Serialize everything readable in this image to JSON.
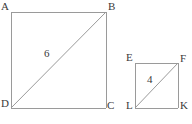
{
  "figure": {
    "background_color": "#ffffff",
    "stroke_color": "#9a9a9a",
    "label_color": "#3a3a3a",
    "stroke_width": 1,
    "canvas": {
      "width": 192,
      "height": 124
    },
    "shapes": [
      {
        "name": "large-square",
        "vertices": [
          {
            "label": "A",
            "x": 11,
            "y": 12,
            "position": "top-left"
          },
          {
            "label": "B",
            "x": 106,
            "y": 12,
            "position": "top-right"
          },
          {
            "label": "C",
            "x": 106,
            "y": 108,
            "position": "bottom-right"
          },
          {
            "label": "D",
            "x": 11,
            "y": 108,
            "position": "bottom-left"
          }
        ],
        "diagonal": {
          "from": "D",
          "to": "B",
          "label": "6",
          "label_x": 44,
          "label_y": 48
        }
      },
      {
        "name": "small-square",
        "vertices": [
          {
            "label": "E",
            "x": 135,
            "y": 63,
            "position": "top-left"
          },
          {
            "label": "F",
            "x": 178,
            "y": 63,
            "position": "top-right"
          },
          {
            "label": "K",
            "x": 178,
            "y": 108,
            "position": "bottom-right"
          },
          {
            "label": "L",
            "x": 135,
            "y": 108,
            "position": "bottom-left"
          }
        ],
        "diagonal": {
          "from": "L",
          "to": "F",
          "label": "4",
          "label_x": 147,
          "label_y": 74
        }
      }
    ],
    "labels": {
      "A": "A",
      "B": "B",
      "C": "C",
      "D": "D",
      "E": "E",
      "F": "F",
      "K": "K",
      "L": "L",
      "large_diagonal": "6",
      "small_diagonal": "4"
    }
  }
}
